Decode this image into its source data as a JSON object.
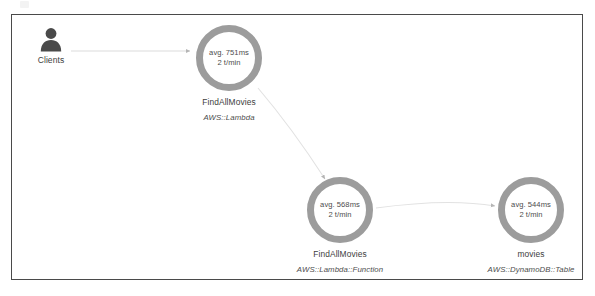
{
  "panel": {
    "background_color": "#ffffff",
    "border_color": "#4a4a4a"
  },
  "actor": {
    "label": "Clients",
    "icon": "person-icon",
    "icon_color": "#4a4a4a"
  },
  "edge_color": "#d8d8d8",
  "node_ring_color": "#9c9c9c",
  "nodes": [
    {
      "name": "FindAllMovies",
      "type": "AWS::Lambda",
      "latency": "avg. 751ms",
      "rate": "2 t/min"
    },
    {
      "name": "FindAllMovies",
      "type": "AWS::Lambda::Function",
      "latency": "avg. 568ms",
      "rate": "2 t/min"
    },
    {
      "name": "movies",
      "type": "AWS::DynamoDB::Table",
      "latency": "avg. 544ms",
      "rate": "2 t/min"
    }
  ]
}
